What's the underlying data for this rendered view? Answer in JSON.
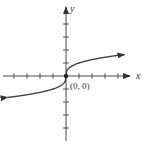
{
  "figure": {
    "function": "y = cube_root(x)",
    "axis_labels": {
      "x": "x",
      "y": "y"
    },
    "point_label": "(0, 0)",
    "origin_px": [
      66,
      76
    ],
    "unit_px": 13,
    "x_ticks": [
      -4,
      -3,
      -2,
      -1,
      1,
      2,
      3,
      4
    ],
    "y_ticks": [
      -4,
      -3,
      -2,
      -1,
      1,
      2,
      3,
      4
    ],
    "colors": {
      "axis": "#333333",
      "curve": "#444444",
      "point": "#222222"
    }
  }
}
